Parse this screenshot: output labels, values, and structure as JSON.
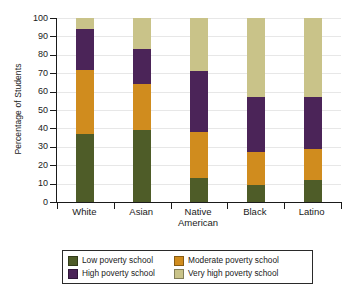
{
  "chart_data": {
    "type": "bar",
    "subtype": "stacked-bar-100",
    "title": "",
    "xlabel": "",
    "ylabel": "Percentage of Students",
    "ylim": [
      0,
      100
    ],
    "ytick_step": 10,
    "yticks": [
      0,
      10,
      20,
      30,
      40,
      50,
      60,
      70,
      80,
      90,
      100
    ],
    "grid": true,
    "legend_position": "bottom",
    "categories": [
      "White",
      "Asian",
      "Native American",
      "Black",
      "Latino"
    ],
    "category_lines": [
      [
        "White"
      ],
      [
        "Asian"
      ],
      [
        "Native",
        "American"
      ],
      [
        "Black"
      ],
      [
        "Latino"
      ]
    ],
    "series": [
      {
        "name": "Low poverty school",
        "color": "#4e5c28",
        "values": [
          37,
          39,
          13,
          9,
          12
        ]
      },
      {
        "name": "Moderate poverty school",
        "color": "#d08c1e",
        "values": [
          35,
          25,
          25,
          18,
          17
        ]
      },
      {
        "name": "High poverty school",
        "color": "#4b2458",
        "values": [
          22,
          19,
          33,
          30,
          28
        ]
      },
      {
        "name": "Very high poverty school",
        "color": "#c9c389",
        "values": [
          6,
          17,
          29,
          43,
          43
        ]
      }
    ],
    "cumulative_tops": {
      "White": [
        37,
        72,
        94,
        100
      ],
      "Asian": [
        39,
        64,
        83,
        100
      ],
      "Native American": [
        13,
        38,
        71,
        100
      ],
      "Black": [
        9,
        27,
        57,
        100
      ],
      "Latino": [
        12,
        29,
        57,
        100
      ]
    }
  },
  "legend": {
    "entries": [
      {
        "label": "Low poverty school",
        "color": "#4e5c28"
      },
      {
        "label": "Moderate poverty school",
        "color": "#d08c1e"
      },
      {
        "label": "High poverty school",
        "color": "#4b2458"
      },
      {
        "label": "Very high poverty school",
        "color": "#c9c389"
      }
    ]
  },
  "axis": {
    "y_title": "Percentage of Students",
    "y_labels": [
      "0",
      "10",
      "20",
      "30",
      "40",
      "50",
      "60",
      "70",
      "80",
      "90",
      "100"
    ],
    "x_labels": [
      "White",
      "Asian",
      "Native American",
      "Black",
      "Latino"
    ]
  }
}
